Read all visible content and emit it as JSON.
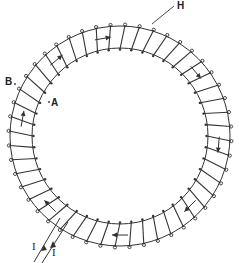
{
  "diagram": {
    "type": "toroidal-solenoid",
    "labels": {
      "H": "H",
      "B": "B",
      "A": "A",
      "I_in": "I",
      "I_out": "I"
    },
    "geometry": {
      "center": [
        120,
        136
      ],
      "outer_radius": 110,
      "inner_radius": 88,
      "turns": 48
    },
    "field_arrows_direction": "clockwise",
    "colors": {
      "line": "#333333",
      "background": "#ffffff"
    }
  }
}
